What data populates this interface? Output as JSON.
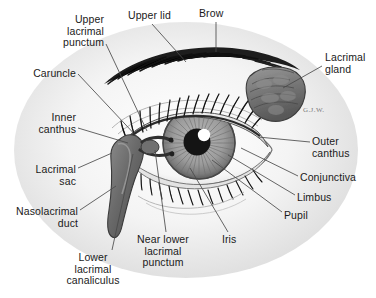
{
  "figure": {
    "background_color": "#ffffff",
    "text_color": "#1a1a1a",
    "signature": "G.J.W."
  },
  "labels": [
    {
      "id": "upper-lacrimal-punctum",
      "text": "Upper\nlacrimal\npunctum",
      "align": "right",
      "x": 30,
      "y": 14,
      "w": 74
    },
    {
      "id": "upper-lid",
      "text": "Upper lid",
      "align": "left",
      "x": 128,
      "y": 10,
      "w": 60
    },
    {
      "id": "brow",
      "text": "Brow",
      "align": "left",
      "x": 199,
      "y": 8,
      "w": 40
    },
    {
      "id": "lacrimal-gland",
      "text": "Lacrimal\ngland",
      "align": "left",
      "x": 325,
      "y": 52,
      "w": 48
    },
    {
      "id": "caruncle",
      "text": "Caruncle",
      "align": "right",
      "x": 14,
      "y": 68,
      "w": 62
    },
    {
      "id": "inner-canthus",
      "text": "Inner\ncanthus",
      "align": "right",
      "x": 20,
      "y": 112,
      "w": 56
    },
    {
      "id": "outer-canthus",
      "text": "Outer\ncanthus",
      "align": "left",
      "x": 312,
      "y": 136,
      "w": 56
    },
    {
      "id": "conjunctiva",
      "text": "Conjunctiva",
      "align": "left",
      "x": 300,
      "y": 172,
      "w": 74
    },
    {
      "id": "lacrimal-sac",
      "text": "Lacrimal\nsac",
      "align": "right",
      "x": 12,
      "y": 164,
      "w": 64
    },
    {
      "id": "limbus",
      "text": "Limbus",
      "align": "left",
      "x": 297,
      "y": 192,
      "w": 50
    },
    {
      "id": "pupil",
      "text": "Pupil",
      "align": "left",
      "x": 284,
      "y": 210,
      "w": 40
    },
    {
      "id": "nasolacrimal-duct",
      "text": "Nasolacrimal\nduct",
      "align": "right",
      "x": 2,
      "y": 206,
      "w": 76
    },
    {
      "id": "iris",
      "text": "Iris",
      "align": "left",
      "x": 222,
      "y": 234,
      "w": 26
    },
    {
      "id": "near-lower-lacrimal-punctum",
      "text": "Near lower\nlacrimal\npunctum",
      "align": "center",
      "x": 128,
      "y": 234,
      "w": 70
    },
    {
      "id": "lower-lacrimal-canaliculus",
      "text": "Lower\nlacrimal\ncanaliculus",
      "align": "center",
      "x": 56,
      "y": 252,
      "w": 74
    }
  ],
  "leader_lines": [
    {
      "id": "leader-upper-lacrimal-punctum",
      "x1": 106,
      "y1": 44,
      "x2": 147,
      "y2": 131
    },
    {
      "id": "leader-upper-lid",
      "x1": 152,
      "y1": 24,
      "x2": 186,
      "y2": 62
    },
    {
      "id": "leader-brow",
      "x1": 216,
      "y1": 22,
      "x2": 216,
      "y2": 52
    },
    {
      "id": "leader-lacrimal-gland",
      "x1": 322,
      "y1": 66,
      "x2": 283,
      "y2": 88
    },
    {
      "id": "leader-caruncle",
      "x1": 78,
      "y1": 74,
      "x2": 140,
      "y2": 140
    },
    {
      "id": "leader-inner-canthus",
      "x1": 78,
      "y1": 128,
      "x2": 128,
      "y2": 143
    },
    {
      "id": "leader-outer-canthus",
      "x1": 310,
      "y1": 142,
      "x2": 258,
      "y2": 137
    },
    {
      "id": "leader-conjunctiva",
      "x1": 298,
      "y1": 176,
      "x2": 241,
      "y2": 148
    },
    {
      "id": "leader-lacrimal-sac",
      "x1": 78,
      "y1": 168,
      "x2": 112,
      "y2": 153
    },
    {
      "id": "leader-limbus",
      "x1": 295,
      "y1": 195,
      "x2": 228,
      "y2": 155
    },
    {
      "id": "leader-pupil",
      "x1": 282,
      "y1": 212,
      "x2": 212,
      "y2": 160
    },
    {
      "id": "leader-nasolacrimal-duct",
      "x1": 80,
      "y1": 210,
      "x2": 116,
      "y2": 186
    },
    {
      "id": "leader-iris",
      "x1": 228,
      "y1": 232,
      "x2": 190,
      "y2": 168
    },
    {
      "id": "leader-near-lower-punctum",
      "x1": 166,
      "y1": 232,
      "x2": 155,
      "y2": 150
    },
    {
      "id": "leader-lower-canaliculus",
      "x1": 112,
      "y1": 250,
      "x2": 133,
      "y2": 154
    }
  ]
}
